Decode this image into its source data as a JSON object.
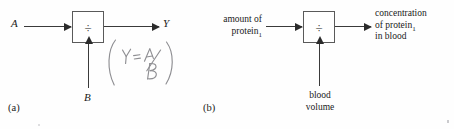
{
  "figure": {
    "operator_symbol": "÷",
    "ink_color": "#2b2b2b",
    "handwriting_color": "#8e8e92",
    "background_color": "#fefefe"
  },
  "panel_a": {
    "caption": "(a)",
    "input_top_label": "A",
    "input_bottom_label": "B",
    "output_label": "Y",
    "operator_symbol": "÷",
    "annotation_text": "(Y = A/B)",
    "annotation_parts": {
      "open_paren": "(",
      "lhs": "Y",
      "equals": "=",
      "numerator": "A",
      "slash": "/",
      "denominator": "B",
      "close_paren": ")"
    }
  },
  "panel_b": {
    "caption": "(b)",
    "input_top_line1": "amount of",
    "input_top_line2_text": "protein",
    "input_top_line2_subscript": "1",
    "input_bottom_line1": "blood",
    "input_bottom_line2": "volume",
    "output_line1": "concentration",
    "output_line2_text": "of protein",
    "output_line2_subscript": "1",
    "output_line3": "in blood",
    "operator_symbol": "÷"
  }
}
